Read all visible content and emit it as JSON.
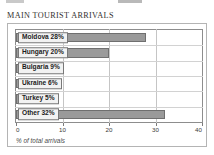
{
  "page": {
    "title": "MAIN TOURIST ARRIVALS"
  },
  "chart_data": {
    "type": "bar",
    "orientation": "horizontal",
    "title": "MAIN TOURIST ARRIVALS",
    "xlabel": "% of total arrivals",
    "ylabel": "",
    "xlim": [
      0,
      40
    ],
    "xticks": [
      0,
      10,
      20,
      30,
      40
    ],
    "xtick_labels": [
      "0",
      "10",
      "20",
      "30",
      "40"
    ],
    "grid": true,
    "legend": "none",
    "categories": [
      "Moldova",
      "Hungary",
      "Bulgaria",
      "Ukraine",
      "Turkey",
      "Other"
    ],
    "values": [
      28,
      20,
      9,
      6,
      5,
      32
    ],
    "bar_labels": [
      "Moldova 28%",
      "Hungary 20%",
      "Bulgaria 9%",
      "Ukraine 6%",
      "Turkey 5%",
      "Other 32%"
    ],
    "colors": {
      "bar_fill": "#9a9a9a",
      "bar_edge": "#6f6f6f",
      "label_box": "#f2f2f2",
      "grid": "#c5c5c5",
      "axis": "#8d8d8d"
    }
  }
}
